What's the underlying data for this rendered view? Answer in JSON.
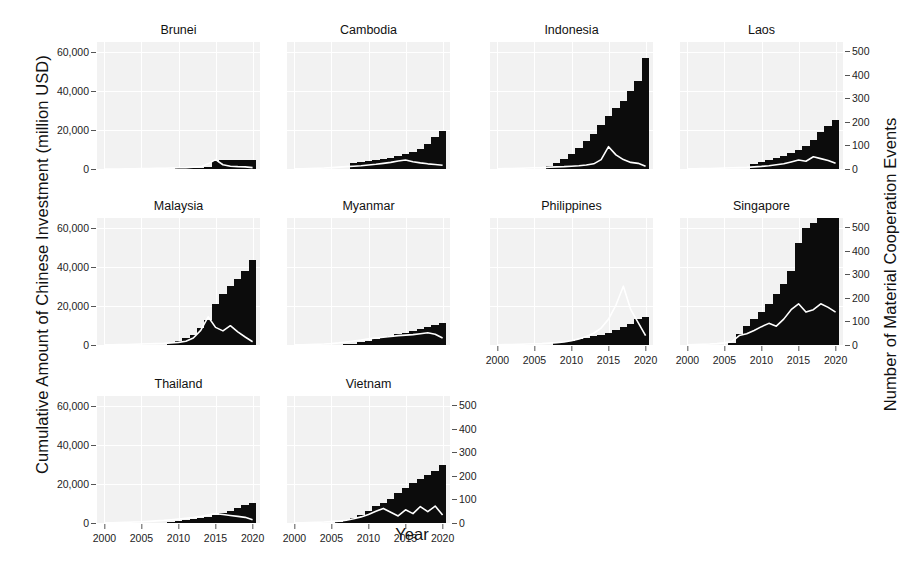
{
  "chart_data": {
    "type": "bar",
    "title": "",
    "xlabel": "Year",
    "ylabel": "Cumulative Amount of Chinese Investment (million USD)",
    "ylabel_right": "Number of Material Cooperation Events",
    "grid": true,
    "legend": "none",
    "x": [
      2000,
      2001,
      2002,
      2003,
      2004,
      2005,
      2006,
      2007,
      2008,
      2009,
      2010,
      2011,
      2012,
      2013,
      2014,
      2015,
      2016,
      2017,
      2018,
      2019,
      2020
    ],
    "xlim": [
      1999,
      2021
    ],
    "xticks": [
      2000,
      2005,
      2010,
      2015,
      2020
    ],
    "xtick_labels": [
      "2000",
      "2005",
      "2010",
      "2015",
      "2020"
    ],
    "ylim_left": [
      0,
      65000
    ],
    "yticks_left": [
      0,
      20000,
      40000,
      60000
    ],
    "ytick_labels_left": [
      "0",
      "20,000",
      "40,000",
      "60,000"
    ],
    "ylim_right": [
      0,
      540
    ],
    "yticks_right": [
      0,
      100,
      200,
      300,
      400,
      500
    ],
    "ytick_labels_right": [
      "0",
      "100",
      "200",
      "300",
      "400",
      "500"
    ],
    "bar_color": "#0c0c0c",
    "line_color": "#ffffff",
    "panel_bg": "#f2f2f2",
    "panels": [
      {
        "name": "Brunei",
        "row": 0,
        "col": 0,
        "bars": [
          0,
          0,
          0,
          0,
          0,
          0,
          0,
          0,
          0,
          0,
          300,
          400,
          500,
          700,
          900,
          4300,
          4400,
          4400,
          4400,
          4400,
          4400
        ],
        "line": [
          0,
          0,
          0,
          1,
          1,
          2,
          2,
          3,
          3,
          4,
          5,
          6,
          8,
          10,
          22,
          40,
          18,
          12,
          10,
          9,
          6
        ]
      },
      {
        "name": "Cambodia",
        "row": 0,
        "col": 1,
        "bars": [
          0,
          0,
          0,
          0,
          0,
          0,
          0,
          0,
          3000,
          3400,
          3900,
          4400,
          5000,
          5800,
          6600,
          7600,
          8900,
          10500,
          13000,
          16500,
          19500
        ],
        "line": [
          1,
          1,
          2,
          3,
          4,
          6,
          8,
          10,
          12,
          14,
          17,
          20,
          24,
          28,
          34,
          38,
          31,
          26,
          22,
          19,
          16
        ]
      },
      {
        "name": "Indonesia",
        "row": 0,
        "col": 2,
        "bars": [
          0,
          0,
          0,
          0,
          0,
          0,
          0,
          1500,
          3000,
          5000,
          7500,
          11000,
          14500,
          18000,
          22500,
          27000,
          31000,
          35000,
          40000,
          45000,
          57000
        ],
        "line": [
          1,
          2,
          2,
          3,
          4,
          5,
          6,
          8,
          9,
          10,
          12,
          14,
          17,
          22,
          40,
          95,
          60,
          40,
          28,
          24,
          12
        ]
      },
      {
        "name": "Laos",
        "row": 0,
        "col": 3,
        "bars": [
          0,
          0,
          0,
          0,
          0,
          0,
          0,
          0,
          0,
          2600,
          3600,
          4500,
          5500,
          6700,
          8100,
          9600,
          11700,
          14800,
          19000,
          22000,
          25000
        ],
        "line": [
          1,
          1,
          2,
          2,
          3,
          4,
          5,
          6,
          7,
          9,
          11,
          14,
          18,
          22,
          30,
          38,
          33,
          52,
          44,
          36,
          24
        ]
      },
      {
        "name": "Malaysia",
        "row": 1,
        "col": 0,
        "bars": [
          0,
          0,
          0,
          0,
          0,
          0,
          0,
          0,
          0,
          1200,
          2200,
          3500,
          5200,
          8800,
          13000,
          21000,
          26000,
          30000,
          34000,
          38000,
          43500
        ],
        "line": [
          1,
          1,
          2,
          2,
          3,
          4,
          5,
          6,
          7,
          9,
          11,
          16,
          30,
          62,
          120,
          75,
          60,
          82,
          56,
          34,
          14
        ]
      },
      {
        "name": "Myanmar",
        "row": 1,
        "col": 1,
        "bars": [
          0,
          0,
          0,
          0,
          0,
          0,
          0,
          300,
          700,
          1300,
          2200,
          3100,
          4000,
          4800,
          5600,
          6400,
          7200,
          8000,
          9200,
          10500,
          11500
        ],
        "line": [
          1,
          1,
          2,
          3,
          4,
          6,
          9,
          13,
          17,
          21,
          26,
          30,
          33,
          36,
          40,
          42,
          44,
          48,
          52,
          46,
          30
        ]
      },
      {
        "name": "Philippines",
        "row": 1,
        "col": 2,
        "bars": [
          0,
          0,
          0,
          0,
          0,
          0,
          0,
          0,
          900,
          1500,
          2200,
          2900,
          3700,
          4400,
          5300,
          6300,
          7500,
          9200,
          11000,
          13500,
          14500
        ],
        "line": [
          1,
          2,
          2,
          3,
          4,
          5,
          6,
          8,
          10,
          13,
          18,
          26,
          36,
          50,
          72,
          110,
          170,
          250,
          150,
          95,
          40
        ]
      },
      {
        "name": "Singapore",
        "row": 1,
        "col": 3,
        "bars": [
          0,
          0,
          0,
          0,
          0,
          0,
          1000,
          5500,
          9500,
          13500,
          17000,
          21000,
          26000,
          31000,
          38000,
          52000,
          60000,
          62500,
          67000,
          70000,
          74000
        ],
        "line": [
          1,
          2,
          3,
          4,
          6,
          9,
          14,
          40,
          48,
          62,
          78,
          92,
          80,
          110,
          150,
          175,
          140,
          150,
          175,
          160,
          140
        ]
      },
      {
        "name": "Thailand",
        "row": 2,
        "col": 0,
        "bars": [
          0,
          0,
          0,
          0,
          0,
          0,
          0,
          0,
          0,
          500,
          900,
          1300,
          1800,
          2400,
          3200,
          4200,
          5200,
          6400,
          7800,
          9200,
          10500
        ],
        "line": [
          1,
          1,
          2,
          3,
          4,
          5,
          7,
          9,
          11,
          14,
          17,
          20,
          23,
          28,
          34,
          40,
          36,
          32,
          28,
          24,
          14
        ]
      },
      {
        "name": "Vietnam",
        "row": 2,
        "col": 1,
        "bars": [
          0,
          0,
          0,
          0,
          0,
          0,
          700,
          1500,
          2700,
          4100,
          6000,
          8500,
          10500,
          12500,
          15500,
          18000,
          20500,
          22500,
          24500,
          26500,
          29500
        ],
        "line": [
          1,
          1,
          2,
          3,
          4,
          6,
          8,
          12,
          18,
          26,
          36,
          50,
          62,
          46,
          30,
          56,
          40,
          70,
          48,
          72,
          34
        ]
      }
    ]
  }
}
